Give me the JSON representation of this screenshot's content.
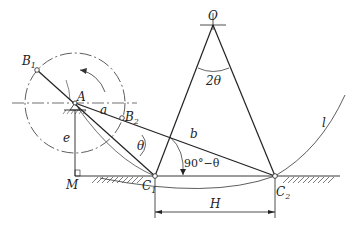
{
  "diagram": {
    "type": "crank-rocker mechanism (offset slider-crank with rocker) — extreme positions",
    "points": {
      "O": {
        "label": "O",
        "x": 213,
        "y": 25
      },
      "A": {
        "label": "A",
        "x": 75,
        "y": 103
      },
      "B1": {
        "label": "B",
        "sub": "1",
        "x": 37,
        "y": 70
      },
      "B2": {
        "label": "B",
        "sub": "2",
        "x": 122,
        "y": 118
      },
      "C1": {
        "label": "C",
        "sub": "1",
        "x": 155,
        "y": 176
      },
      "C2": {
        "label": "C",
        "sub": "2",
        "x": 275,
        "y": 176
      },
      "M": {
        "label": "M",
        "x": 75,
        "y": 176
      }
    },
    "labels": {
      "link_a": "a",
      "link_b": "b",
      "offset_e": "e",
      "stroke_H": "H",
      "curve_l": "l",
      "angle_theta": "θ",
      "angle_2theta": "2θ",
      "angle_90_minus_theta": "90°−θ"
    },
    "colors": {
      "line": "#222222",
      "background": "#ffffff"
    }
  }
}
